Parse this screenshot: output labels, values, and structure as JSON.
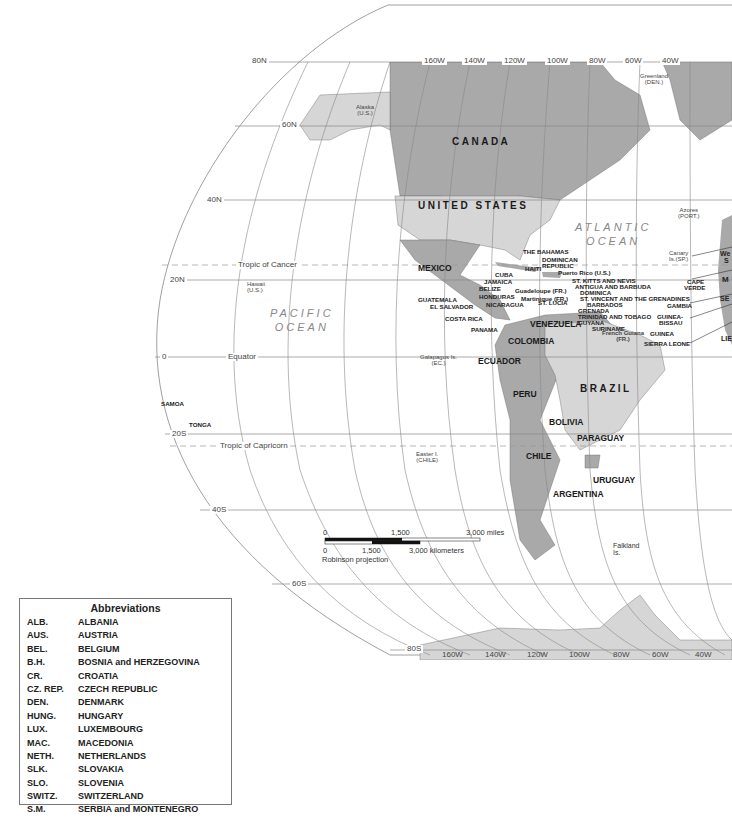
{
  "map": {
    "projection": "Robinson projection",
    "colors": {
      "land_dark": "#a9a9a9",
      "land_light": "#d6d6d6",
      "ocean": "#ffffff",
      "grid": "#777777"
    },
    "latitude_labels": [
      "80N",
      "60N",
      "40N",
      "20N",
      "0",
      "20S",
      "40S",
      "60S",
      "80S"
    ],
    "longitude_labels_top": [
      "160W",
      "140W",
      "120W",
      "100W",
      "80W",
      "60W",
      "40W"
    ],
    "longitude_labels_bottom": [
      "160W",
      "140W",
      "120W",
      "100W",
      "80W",
      "60W",
      "40W"
    ],
    "lines": {
      "tropic_cancer": "Tropic of Cancer",
      "equator": "Equator",
      "tropic_capricorn": "Tropic of Capricorn"
    },
    "oceans": {
      "pacific": "PACIFIC\nOCEAN",
      "atlantic": "ATLANTIC\nOCEAN"
    },
    "major_countries": {
      "canada": "CANADA",
      "usa": "UNITED STATES",
      "mexico": "MEXICO",
      "brazil": "BRAZIL",
      "venezuela": "VENEZUELA",
      "colombia": "COLOMBIA",
      "ecuador": "ECUADOR",
      "peru": "PERU",
      "bolivia": "BOLIVIA",
      "paraguay": "PARAGUAY",
      "chile": "CHILE",
      "uruguay": "URUGUAY",
      "argentina": "ARGENTINA"
    },
    "territories": {
      "alaska": "Alaska",
      "alaska_sub": "(U.S.)",
      "greenland": "Greenland",
      "greenland_sub": "(DEN.)",
      "hawaii": "Hawaii",
      "hawaii_sub": "(U.S.)",
      "azores": "Azores",
      "azores_sub": "(PORT.)",
      "canary": "Canary",
      "canary_sub": "Is.(SP.)",
      "galapagos": "Galapagos Is.",
      "galapagos_sub": "(EC.)",
      "easter": "Easter I.",
      "easter_sub": "(CHILE)",
      "falkland": "Falkland",
      "falkland_sub": "Is.",
      "french_guiana": "French Guiana",
      "french_guiana_sub": "(FR.)",
      "puerto_rico": "Puerto Rico (U.S.)",
      "guadeloupe": "Guadeloupe (FR.)",
      "martinique": "Martinique (FR.)"
    },
    "small_countries": {
      "bahamas": "THE BAHAMAS",
      "dominican": "DOMINICAN",
      "dominican2": "REPUBLIC",
      "haiti": "HAITI",
      "cuba": "CUBA",
      "jamaica": "JAMAICA",
      "belize": "BELIZE",
      "honduras": "HONDURAS",
      "guatemala": "GUATEMALA",
      "el_salvador": "EL SALVADOR",
      "nicaragua": "NICARAGUA",
      "costa_rica": "COSTA RICA",
      "panama": "PANAMA",
      "st_kitts": "ST. KITTS AND NEVIS",
      "antigua": "ANTIGUA AND BARBUDA",
      "dominica": "DOMINICA",
      "st_lucia": "ST. LUCIA",
      "st_vincent": "ST. VINCENT AND THE GRENADINES",
      "barbados": "BARBADOS",
      "grenada": "GRENADA",
      "trinidad": "TRINIDAD AND TOBAGO",
      "guyana": "GUYANA",
      "suriname": "SURINAME",
      "cape_verde": "CAPE",
      "cape_verde2": "VERDE",
      "gambia": "GAMBIA",
      "guinea_bissau": "GUINEA-",
      "guinea_bissau2": "BISSAU",
      "guinea": "GUINEA",
      "sierra_leone": "SIERRA LEONE",
      "samoa": "SAMOA",
      "tonga": "TONGA",
      "edge_we": "We",
      "edge_s": "S",
      "edge_m": "M",
      "edge_se": "SE",
      "edge_lie": "LIE"
    },
    "scale_bar": {
      "miles": [
        "0",
        "1,500",
        "3,000 miles"
      ],
      "kilometers": [
        "0",
        "1,500",
        "3,000 kilometers"
      ]
    }
  },
  "abbreviations": {
    "title": "Abbreviations",
    "items": [
      {
        "code": "ALB.",
        "name": "ALBANIA"
      },
      {
        "code": "AUS.",
        "name": "AUSTRIA"
      },
      {
        "code": "BEL.",
        "name": "BELGIUM"
      },
      {
        "code": "B.H.",
        "name": "BOSNIA and HERZEGOVINA"
      },
      {
        "code": "CR.",
        "name": "CROATIA"
      },
      {
        "code": "CZ. REP.",
        "name": "CZECH REPUBLIC"
      },
      {
        "code": "DEN.",
        "name": "DENMARK"
      },
      {
        "code": "HUNG.",
        "name": "HUNGARY"
      },
      {
        "code": "LUX.",
        "name": "LUXEMBOURG"
      },
      {
        "code": "MAC.",
        "name": "MACEDONIA"
      },
      {
        "code": "NETH.",
        "name": "NETHERLANDS"
      },
      {
        "code": "SLK.",
        "name": "SLOVAKIA"
      },
      {
        "code": "SLO.",
        "name": "SLOVENIA"
      },
      {
        "code": "SWITZ.",
        "name": "SWITZERLAND"
      },
      {
        "code": "S.M.",
        "name": "SERBIA and MONTENEGRO"
      }
    ]
  }
}
